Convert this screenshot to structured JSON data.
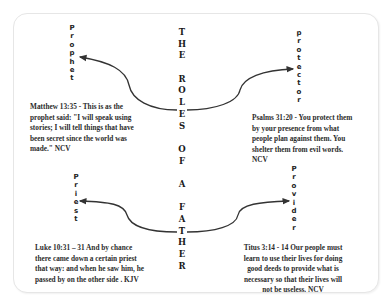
{
  "title": {
    "lines": [
      [
        "T",
        "H",
        "E"
      ],
      [
        "R",
        "O",
        "L",
        "E",
        "S"
      ],
      [
        "O",
        "F"
      ],
      [
        "A"
      ],
      [
        "F",
        "A",
        "T",
        "H",
        "E",
        "R"
      ]
    ],
    "full_text": "THE ROLES OF A FATHER"
  },
  "roles": [
    {
      "name": "Prophet",
      "letters": [
        "P",
        "r",
        "o",
        "p",
        "h",
        "e",
        "t"
      ],
      "verse": "Matthew 13:35 - This is as the prophet said: \"I will speak using stories; I will tell things that have been secret since the world was made.\" NCV"
    },
    {
      "name": "protector",
      "letters": [
        "p",
        "r",
        "o",
        "t",
        "e",
        "c",
        "t",
        "o",
        "r"
      ],
      "verse": "Psalms 31:20 - You protect them by your presence from what people plan against them. You shelter them from evil words. NCV"
    },
    {
      "name": "Priest",
      "letters": [
        "P",
        "r",
        "i",
        "e",
        "s",
        "t"
      ],
      "verse": "Luke 10:31 – 31 And by chance there came down a certain priest that way: and when he saw him, he passed by on the other side . KJV"
    },
    {
      "name": "Provider",
      "letters": [
        "P",
        "r",
        "o",
        "v",
        "i",
        "d",
        "e",
        "r"
      ],
      "verse": "Titus 3:14 - 14 Our people must learn to use their lives for doing good deeds to provide what is necessary so that their lives will not be useless. NCV"
    }
  ],
  "colors": {
    "text": "#222222",
    "arrow": "#333333",
    "border": "#e6e6e6"
  }
}
